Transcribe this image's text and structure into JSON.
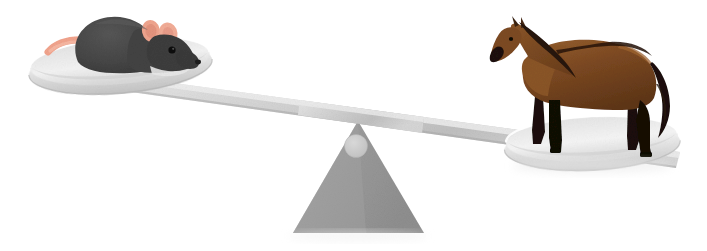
{
  "illustration": {
    "title": "Unbalanced balance scale comparing a mouse and a horse",
    "alt_text": "A gray see-saw style balance scale on a white background. The left pan, raised high, holds a small dark gray mouse with pink ears and a pink tail. The right pan, tipped down to the ground, holds a large brown bay horse with black legs, mane and tail. A gray triangular fulcrum with a light circular pivot supports the beam at the center.",
    "background_color": "#ffffff",
    "width": 707,
    "height": 251
  },
  "scale": {
    "name": "balance-scale",
    "state": "unbalanced-right-heavy",
    "fulcrum": {
      "label": "fulcrum-triangle",
      "color": "#9a9a9a",
      "apex": {
        "x": 358,
        "y": 122
      },
      "base_left": {
        "x": 296,
        "y": 232
      },
      "base_right": {
        "x": 421,
        "y": 232
      }
    },
    "pivot": {
      "label": "pivot-circle",
      "color": "#c9c9c9",
      "center": {
        "x": 356,
        "y": 147
      },
      "radius": 11
    },
    "beam": {
      "label": "balance-beam",
      "color_light": "#dcdcdc",
      "color_mid": "#c6c6c6",
      "color_dark": "#b4b4b4",
      "left_end": {
        "x": 133,
        "y": 83
      },
      "right_end": {
        "x": 662,
        "y": 160
      },
      "angle_description": "tilted down toward the right"
    }
  },
  "pans": [
    {
      "name": "left-pan",
      "side": "left",
      "position": "raised",
      "center": {
        "x": 120,
        "y": 62
      },
      "rx": 92,
      "ry": 27,
      "rotation_deg": -4,
      "fill_top": "#f2f2f2",
      "fill_bottom": "#cdcdcd",
      "rim_color": "#b8b8b8"
    },
    {
      "name": "right-pan",
      "side": "right",
      "position": "lowered",
      "center": {
        "x": 592,
        "y": 140
      },
      "rx": 88,
      "ry": 26,
      "rotation_deg": -3,
      "fill_top": "#f4f4f4",
      "fill_bottom": "#d2d2d2",
      "rim_color": "#bcbcbc"
    }
  ],
  "animals": {
    "mouse": {
      "name": "mouse",
      "label": "mouse-on-left-pan",
      "side": "left",
      "body_color": "#4a4a4a",
      "body_color_dark": "#3a3a3a",
      "ear_color": "#f0a58e",
      "tail_color": "#f2a48d",
      "eye_color": "#111111",
      "nose_color": "#2a2a2a",
      "bounds": {
        "x": 45,
        "y": 16,
        "width": 150,
        "height": 60
      }
    },
    "horse": {
      "name": "horse",
      "label": "horse-on-right-pan",
      "side": "right",
      "coat": "bay",
      "body_color": "#7d4a22",
      "body_color_light": "#955c2e",
      "body_color_dark": "#5e3517",
      "mane_color": "#241207",
      "leg_color": "#120b06",
      "tail_color": "#1b1008",
      "hoof_color": "#0b0705",
      "bounds": {
        "x": 489,
        "y": 22,
        "width": 185,
        "height": 134
      }
    }
  },
  "shadows": {
    "ground_shadow_color": "#ededed",
    "pan_shadow_color": "#e4e4e4"
  }
}
